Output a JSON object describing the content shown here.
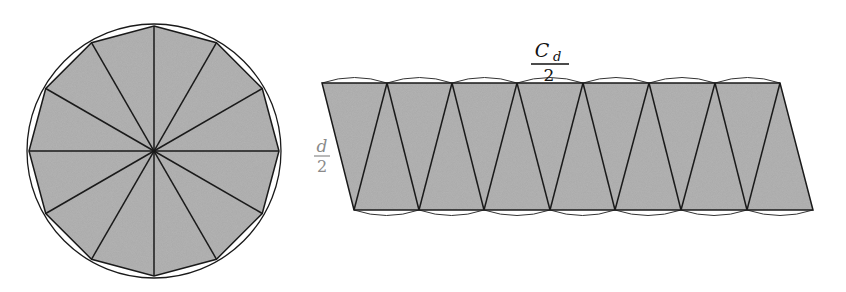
{
  "figure": {
    "left": {
      "description": "Circle divided into 12 equal sectors, inscribed dodecagon shaded",
      "center": [
        154,
        151
      ],
      "radius": 125,
      "sectors": 12,
      "fill_color": "#a9a9a9",
      "stroke_color": "#1a1a1a"
    },
    "right": {
      "description": "Sectors rearranged into an approximate parallelogram",
      "top_y": 83,
      "bottom_y": 210,
      "top_xs": [
        322,
        387,
        452,
        517,
        583,
        649,
        715,
        780
      ],
      "bottom_xs": [
        354,
        419,
        484,
        550,
        615,
        681,
        747,
        813
      ],
      "fill_color": "#a9a9a9",
      "stroke_color": "#1a1a1a"
    },
    "labels": {
      "top_numerator_main": "C",
      "top_numerator_sub": "d",
      "top_denominator": "2",
      "side_numerator": "d",
      "side_denominator": "2"
    }
  }
}
